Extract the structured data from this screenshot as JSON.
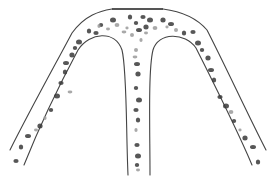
{
  "figure": {
    "colors": {
      "background": "#ffffff",
      "outline": "#444444",
      "blob_dark": "#3a3a3a",
      "blob_light": "#9a9a9a"
    },
    "dots_dark": [
      [
        130,
        17
      ],
      [
        143,
        17
      ],
      [
        150,
        20
      ],
      [
        136,
        23
      ],
      [
        146,
        27
      ],
      [
        139,
        30
      ],
      [
        89,
        31
      ],
      [
        96,
        33
      ],
      [
        79,
        42
      ],
      [
        75,
        48
      ],
      [
        72,
        55
      ],
      [
        66,
        63
      ],
      [
        65,
        72
      ],
      [
        61,
        83
      ],
      [
        57,
        96
      ],
      [
        51,
        110
      ],
      [
        40,
        126
      ],
      [
        28,
        136
      ],
      [
        21,
        147
      ],
      [
        16,
        161
      ],
      [
        113,
        20
      ],
      [
        101,
        25
      ],
      [
        163,
        20
      ],
      [
        171,
        24
      ],
      [
        184,
        33
      ],
      [
        193,
        32
      ],
      [
        198,
        43
      ],
      [
        202,
        50
      ],
      [
        208,
        58
      ],
      [
        211,
        70
      ],
      [
        214,
        80
      ],
      [
        220,
        97
      ],
      [
        226,
        106
      ],
      [
        234,
        121
      ],
      [
        245,
        138
      ],
      [
        253,
        147
      ],
      [
        258,
        162
      ],
      [
        136,
        110
      ],
      [
        139,
        100
      ],
      [
        136,
        88
      ],
      [
        138,
        74
      ],
      [
        137,
        64
      ],
      [
        138,
        120
      ],
      [
        137,
        145
      ],
      [
        138,
        156
      ],
      [
        137,
        165
      ]
    ],
    "dots_light": [
      [
        99,
        26
      ],
      [
        108,
        29
      ],
      [
        117,
        25
      ],
      [
        127,
        28
      ],
      [
        132,
        35
      ],
      [
        124,
        32
      ],
      [
        141,
        40
      ],
      [
        146,
        33
      ],
      [
        155,
        28
      ],
      [
        167,
        27
      ],
      [
        176,
        30
      ],
      [
        70,
        92
      ],
      [
        45,
        118
      ],
      [
        36,
        130
      ],
      [
        231,
        112
      ],
      [
        240,
        130
      ],
      [
        136,
        50
      ],
      [
        135,
        57
      ],
      [
        136,
        130
      ],
      [
        138,
        170
      ]
    ]
  }
}
